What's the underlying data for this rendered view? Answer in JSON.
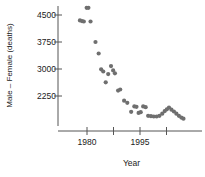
{
  "chart_data": {
    "type": "scatter",
    "title": "",
    "xlabel": "Year",
    "ylabel": "Male – Female (deaths)",
    "xlim": [
      1977.0,
      2008.0
    ],
    "ylim": [
      1500,
      4800
    ],
    "grid": false,
    "legend": null,
    "marker_color": "#6f6f6f",
    "axis_color": "#555555",
    "xticks": [
      1980,
      1987.5,
      1995,
      2002.5
    ],
    "xtick_labels": [
      "1980",
      "",
      "1995",
      ""
    ],
    "yticks": [
      2250,
      3000,
      3750,
      4500
    ],
    "ytick_labels": [
      "2250",
      "3000",
      "3750",
      "4500"
    ],
    "points": [
      {
        "x": 1978.0,
        "y": 4350
      },
      {
        "x": 1978.6,
        "y": 4330
      },
      {
        "x": 1979.1,
        "y": 4320
      },
      {
        "x": 1979.9,
        "y": 4700
      },
      {
        "x": 1980.4,
        "y": 4700
      },
      {
        "x": 1981.0,
        "y": 4320
      },
      {
        "x": 1982.4,
        "y": 3750
      },
      {
        "x": 1983.3,
        "y": 3430
      },
      {
        "x": 1984.0,
        "y": 2990
      },
      {
        "x": 1984.6,
        "y": 2930
      },
      {
        "x": 1985.3,
        "y": 2630
      },
      {
        "x": 1986.0,
        "y": 2860
      },
      {
        "x": 1986.8,
        "y": 3080
      },
      {
        "x": 1987.4,
        "y": 2960
      },
      {
        "x": 1987.9,
        "y": 2880
      },
      {
        "x": 1988.8,
        "y": 2400
      },
      {
        "x": 1989.4,
        "y": 2430
      },
      {
        "x": 1990.5,
        "y": 2120
      },
      {
        "x": 1991.4,
        "y": 2060
      },
      {
        "x": 1992.5,
        "y": 1810
      },
      {
        "x": 1993.4,
        "y": 1960
      },
      {
        "x": 1994.0,
        "y": 1950
      },
      {
        "x": 1994.6,
        "y": 1780
      },
      {
        "x": 1995.2,
        "y": 1800
      },
      {
        "x": 1995.9,
        "y": 1960
      },
      {
        "x": 1996.6,
        "y": 1940
      },
      {
        "x": 1997.3,
        "y": 1700
      },
      {
        "x": 1998.1,
        "y": 1690
      },
      {
        "x": 1998.9,
        "y": 1680
      },
      {
        "x": 1999.7,
        "y": 1680
      },
      {
        "x": 2000.5,
        "y": 1700
      },
      {
        "x": 2001.3,
        "y": 1760
      },
      {
        "x": 2002.0,
        "y": 1830
      },
      {
        "x": 2002.6,
        "y": 1880
      },
      {
        "x": 2003.2,
        "y": 1930
      },
      {
        "x": 2003.9,
        "y": 1870
      },
      {
        "x": 2004.6,
        "y": 1820
      },
      {
        "x": 2005.3,
        "y": 1760
      },
      {
        "x": 2006.0,
        "y": 1700
      },
      {
        "x": 2006.7,
        "y": 1650
      },
      {
        "x": 2007.3,
        "y": 1620
      }
    ]
  },
  "axes": {
    "y_title": "Male – Female (deaths)",
    "x_title": "Year",
    "ytick_0": "2250",
    "ytick_1": "3000",
    "ytick_2": "3750",
    "ytick_3": "4500",
    "xtick_0": "1980",
    "xtick_1": "1995"
  }
}
